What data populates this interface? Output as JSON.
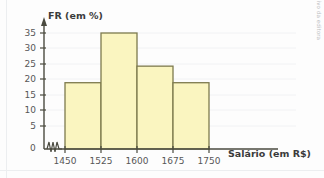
{
  "chart_data": {
    "type": "bar",
    "title": "",
    "subtitle": "",
    "xlabel": "Salário (em R$)",
    "ylabel": "FR (em %)",
    "categories": [
      "1450 - 1525",
      "1525 - 1600",
      "1600 - 1675",
      "1675 - 1750"
    ],
    "bin_edges": [
      1450,
      1525,
      1600,
      1675,
      1750
    ],
    "values": [
      20,
      35,
      25,
      20
    ],
    "xlim": [
      1450,
      1750
    ],
    "ylim": [
      0,
      37
    ],
    "y_ticks": [
      0,
      5,
      10,
      15,
      20,
      25,
      30,
      35
    ],
    "y_tick_labels": [
      "0",
      "5",
      "10",
      "15",
      "20",
      "25",
      "30",
      "35"
    ],
    "x_ticks": [
      1450,
      1525,
      1600,
      1675,
      1750
    ],
    "x_tick_labels": [
      "1450",
      "1525",
      "1600",
      "1675",
      "1750"
    ],
    "grid": "horizontal-faint",
    "legend": "none",
    "axis_break": "zigzag-at-origin",
    "bar_fill_color": "#faf5c0",
    "bar_border_color": "#7d7a4e",
    "axis_color": "#4a4a3f",
    "grid_color": "#f1f2f4",
    "background_color": "#fdfdfd",
    "tick_label_color": "#575757",
    "axis_title_color": "#3b3b3b"
  },
  "credit": {
    "text": "Banco de imagens/Arquivo da editora"
  },
  "axes": {
    "y_title": "FR (em %)",
    "x_title": "Salário (em R$)",
    "zero_label": "0"
  }
}
